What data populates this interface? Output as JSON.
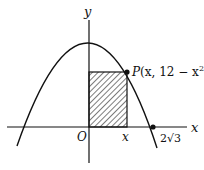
{
  "diagram": {
    "title": "",
    "axes": {
      "x_label": "x",
      "y_label": "y",
      "origin_label": "O"
    },
    "curve": {
      "equation": "y = 12 - x^2",
      "type": "parabola"
    },
    "point_P": {
      "label_prefix": "P",
      "label_coords": "(x, 12 − x",
      "label_exp": "2",
      "label_close": ")"
    },
    "x_marker_label": "x",
    "intercept_label": "2√3",
    "shaded_region": "rectangle from O to P"
  }
}
